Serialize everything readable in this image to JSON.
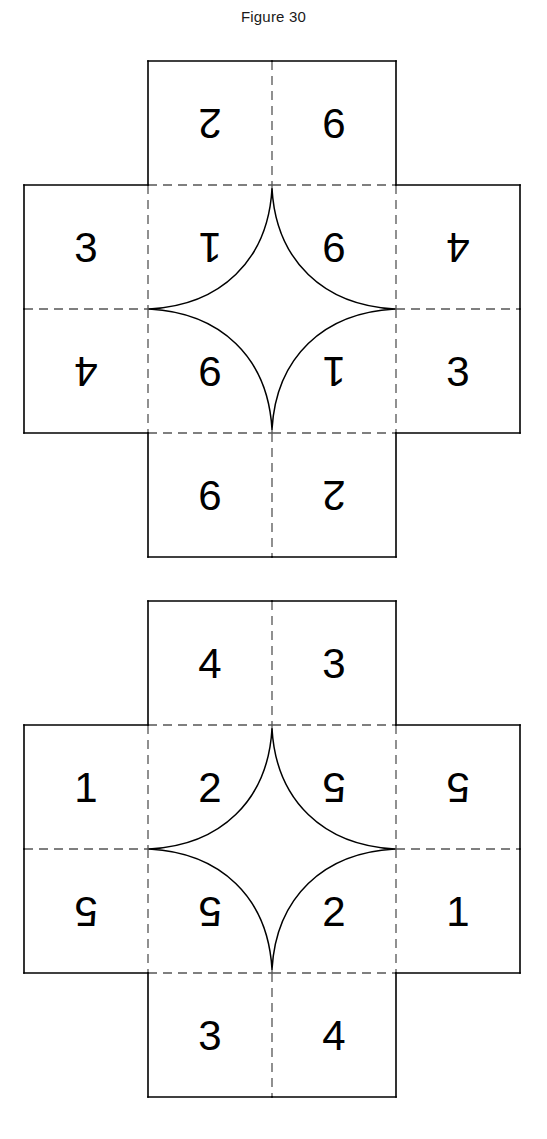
{
  "figure": {
    "title": "Figure 30",
    "type": "cube-net-diagram",
    "colors": {
      "stroke": "#000000",
      "fold_line": "#555555",
      "background": "#ffffff",
      "text": "#000000"
    }
  },
  "diagrams": [
    {
      "id": "cross-1",
      "name": "upper-cross-net",
      "shape": "cross",
      "grid": {
        "cols": 4,
        "rows": 4,
        "omitted_corners": true
      },
      "cells": [
        {
          "row": 0,
          "col": 1,
          "value": "2",
          "rotation": 180
        },
        {
          "row": 0,
          "col": 2,
          "value": "6",
          "rotation": 0
        },
        {
          "row": 1,
          "col": 0,
          "value": "3",
          "rotation": 0
        },
        {
          "row": 1,
          "col": 1,
          "value": "1",
          "rotation": 180
        },
        {
          "row": 1,
          "col": 2,
          "value": "6",
          "rotation": 0
        },
        {
          "row": 1,
          "col": 3,
          "value": "4",
          "rotation": 180
        },
        {
          "row": 2,
          "col": 0,
          "value": "4",
          "rotation": 180
        },
        {
          "row": 2,
          "col": 1,
          "value": "6",
          "rotation": 0
        },
        {
          "row": 2,
          "col": 2,
          "value": "1",
          "rotation": 180
        },
        {
          "row": 2,
          "col": 3,
          "value": "3",
          "rotation": 0
        },
        {
          "row": 3,
          "col": 1,
          "value": "6",
          "rotation": 0
        },
        {
          "row": 3,
          "col": 2,
          "value": "2",
          "rotation": 180
        }
      ]
    },
    {
      "id": "cross-2",
      "name": "lower-cross-net",
      "shape": "cross",
      "grid": {
        "cols": 4,
        "rows": 4,
        "omitted_corners": true
      },
      "cells": [
        {
          "row": 0,
          "col": 1,
          "value": "4",
          "rotation": 0
        },
        {
          "row": 0,
          "col": 2,
          "value": "3",
          "rotation": 0
        },
        {
          "row": 1,
          "col": 0,
          "value": "1",
          "rotation": 0
        },
        {
          "row": 1,
          "col": 1,
          "value": "2",
          "rotation": 0
        },
        {
          "row": 1,
          "col": 2,
          "value": "5",
          "rotation": 180
        },
        {
          "row": 1,
          "col": 3,
          "value": "5",
          "rotation": 180
        },
        {
          "row": 2,
          "col": 0,
          "value": "5",
          "rotation": 180
        },
        {
          "row": 2,
          "col": 1,
          "value": "5",
          "rotation": 180
        },
        {
          "row": 2,
          "col": 2,
          "value": "2",
          "rotation": 0
        },
        {
          "row": 2,
          "col": 3,
          "value": "1",
          "rotation": 0
        },
        {
          "row": 3,
          "col": 1,
          "value": "3",
          "rotation": 0
        },
        {
          "row": 3,
          "col": 2,
          "value": "4",
          "rotation": 0
        }
      ]
    }
  ]
}
